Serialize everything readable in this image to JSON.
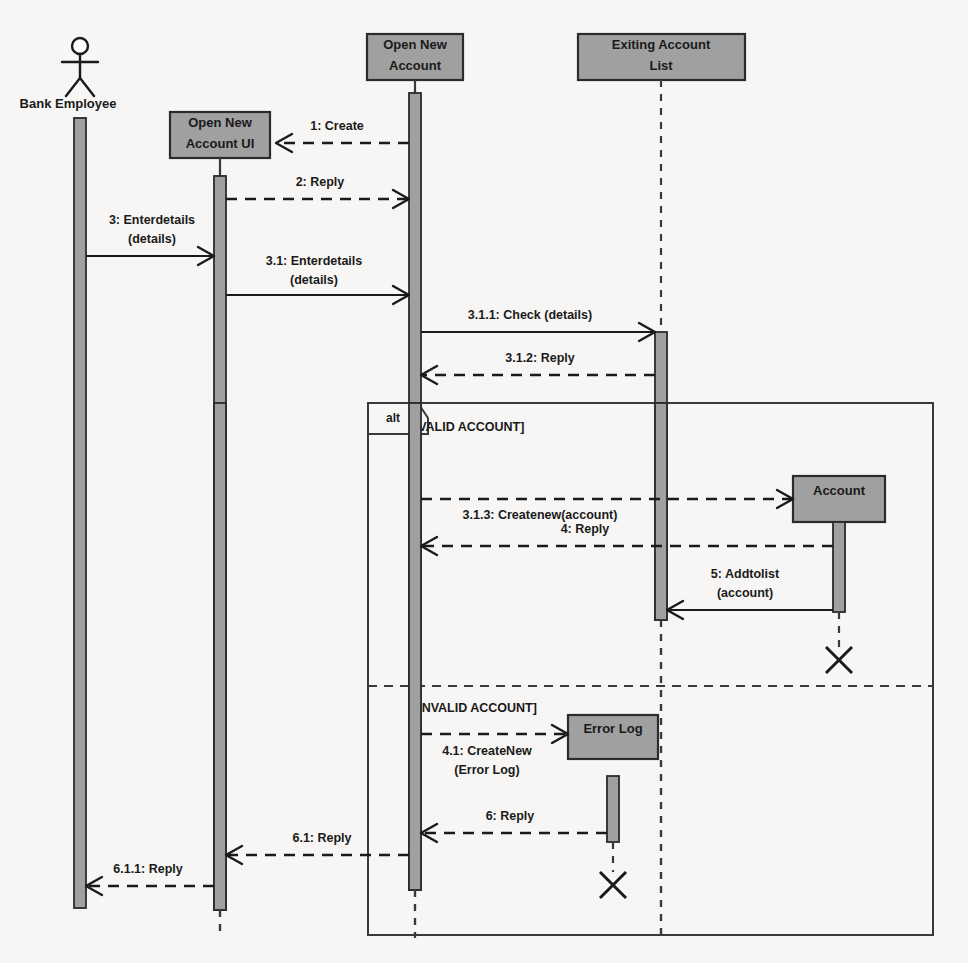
{
  "diagram": {
    "type": "uml-sequence-diagram",
    "background_color": "#f7f6f4",
    "box_fill_color": "#a0a0a0",
    "line_color": "#1a1a1a"
  },
  "actors": [
    {
      "id": "bank-employee",
      "label": "Bank Employee",
      "kind": "actor",
      "x": 80
    }
  ],
  "lifelines": [
    {
      "id": "open-new-account-ui",
      "label_line1": "Open New",
      "label_line2": "Account UI",
      "kind": "object",
      "x": 220
    },
    {
      "id": "open-new-account",
      "label_line1": "Open New",
      "label_line2": "Account",
      "kind": "object",
      "x": 415
    },
    {
      "id": "exiting-account-list",
      "label_line1": "Exiting Account",
      "label_line2": "List",
      "kind": "object",
      "x": 661
    },
    {
      "id": "account",
      "label_line1": "Account",
      "label_line2": "",
      "kind": "object-created",
      "x": 839
    },
    {
      "id": "error-log",
      "label_line1": "Error Log",
      "label_line2": "",
      "kind": "object-created",
      "x": 613
    }
  ],
  "fragment": {
    "operator": "alt",
    "guards": [
      {
        "label": "[VALID ACCOUNT]"
      },
      {
        "label": "[INVALID ACCOUNT]"
      }
    ]
  },
  "messages": [
    {
      "id": "m1",
      "number": "1",
      "name": "Create",
      "label_line1": "1: Create",
      "label_line2": "",
      "style": "dashed",
      "direction": "rtl"
    },
    {
      "id": "m2",
      "number": "2",
      "name": "Reply",
      "label_line1": "2: Reply",
      "label_line2": "",
      "style": "dashed",
      "direction": "ltr"
    },
    {
      "id": "m3",
      "number": "3",
      "name": "Enterdetails",
      "label_line1": "3: Enterdetails",
      "label_line2": "(details)",
      "style": "solid",
      "direction": "ltr"
    },
    {
      "id": "m4",
      "number": "3.1",
      "name": "Enterdetails",
      "label_line1": "3.1: Enterdetails",
      "label_line2": "(details)",
      "style": "solid",
      "direction": "ltr"
    },
    {
      "id": "m5",
      "number": "3.1.1",
      "name": "Check",
      "label_line1": "3.1.1: Check (details)",
      "label_line2": "",
      "style": "solid",
      "direction": "ltr"
    },
    {
      "id": "m6",
      "number": "3.1.2",
      "name": "Reply",
      "label_line1": "3.1.2: Reply",
      "label_line2": "",
      "style": "dashed",
      "direction": "rtl"
    },
    {
      "id": "m7",
      "number": "3.1.3",
      "name": "Createnew",
      "label_line1": "3.1.3: Createnew(account)",
      "label_line2": "",
      "style": "dashed",
      "direction": "ltr"
    },
    {
      "id": "m8",
      "number": "4",
      "name": "Reply",
      "label_line1": "4: Reply",
      "label_line2": "",
      "style": "dashed",
      "direction": "rtl"
    },
    {
      "id": "m9",
      "number": "5",
      "name": "Addtolist",
      "label_line1": "5: Addtolist",
      "label_line2": "(account)",
      "style": "solid",
      "direction": "rtl"
    },
    {
      "id": "m10",
      "number": "4.1",
      "name": "CreateNew",
      "label_line1": "4.1: CreateNew",
      "label_line2": "(Error Log)",
      "style": "dashed",
      "direction": "ltr"
    },
    {
      "id": "m11",
      "number": "6",
      "name": "Reply",
      "label_line1": "6: Reply",
      "label_line2": "",
      "style": "dashed",
      "direction": "rtl"
    },
    {
      "id": "m12",
      "number": "6.1",
      "name": "Reply",
      "label_line1": "6.1: Reply",
      "label_line2": "",
      "style": "dashed",
      "direction": "rtl"
    },
    {
      "id": "m13",
      "number": "6.1.1",
      "name": "Reply",
      "label_line1": "6.1.1: Reply",
      "label_line2": "",
      "style": "dashed",
      "direction": "rtl"
    }
  ]
}
